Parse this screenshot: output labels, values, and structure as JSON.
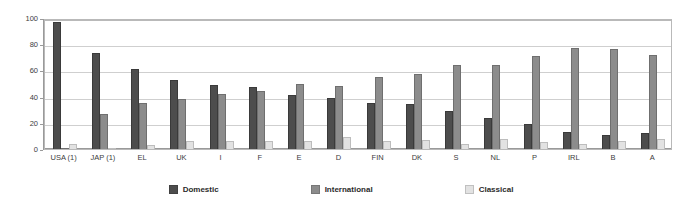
{
  "chart_data": {
    "type": "bar",
    "title": "",
    "xlabel": "",
    "ylabel": "",
    "ylim": [
      0,
      100
    ],
    "yticks": [
      0,
      20,
      40,
      60,
      80,
      100
    ],
    "grid": true,
    "legend_position": "bottom-center",
    "categories": [
      "USA (1)",
      "JAP (1)",
      "EL",
      "UK",
      "I",
      "F",
      "E",
      "D",
      "FIN",
      "DK",
      "S",
      "NL",
      "P",
      "IRL",
      "B",
      "A"
    ],
    "series": [
      {
        "name": "Domestic",
        "color": "#4d4d4d",
        "values": [
          97,
          73,
          61,
          53,
          49,
          47,
          41,
          39,
          35,
          34,
          29,
          24,
          19,
          13,
          11,
          12
        ]
      },
      {
        "name": "International",
        "color": "#8c8c8c",
        "values": [
          1,
          27,
          35,
          38,
          42,
          44,
          50,
          48,
          55,
          57,
          64,
          64,
          71,
          77,
          76,
          72
        ]
      },
      {
        "name": "Classical",
        "color": "#e2e2e2",
        "values": [
          4,
          1,
          3,
          6,
          6,
          6,
          6,
          9,
          6,
          7,
          4,
          8,
          5,
          4,
          6,
          8
        ]
      }
    ]
  },
  "axis": {
    "ytick_labels": [
      "100",
      "80",
      "60",
      "40",
      "20",
      "0"
    ]
  },
  "legend": {
    "items": [
      {
        "label": "Domestic",
        "key": "domestic"
      },
      {
        "label": "International",
        "key": "international"
      },
      {
        "label": "Classical",
        "key": "classical"
      }
    ]
  }
}
